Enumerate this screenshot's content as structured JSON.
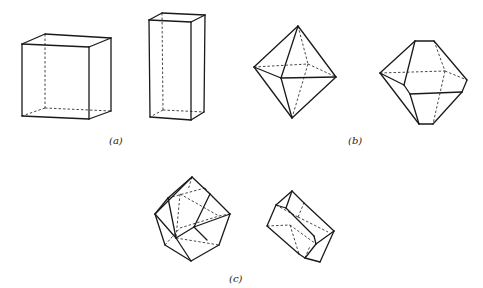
{
  "figure": {
    "panels": [
      {
        "label": "(a)",
        "label_pos": [
          116,
          143
        ],
        "shapes": [
          {
            "name": "cube",
            "solid": [
              [
                22,
                44,
                89,
                47
              ],
              [
                89,
                47,
                89,
                119
              ],
              [
                89,
                119,
                22,
                116
              ],
              [
                22,
                116,
                22,
                44
              ],
              [
                22,
                44,
                45,
                34
              ],
              [
                45,
                34,
                111,
                38
              ],
              [
                111,
                38,
                89,
                47
              ],
              [
                111,
                38,
                111,
                111
              ],
              [
                111,
                111,
                89,
                119
              ]
            ],
            "dashed": [
              [
                45,
                34,
                45,
                108
              ],
              [
                45,
                108,
                111,
                111
              ],
              [
                45,
                108,
                22,
                116
              ]
            ]
          },
          {
            "name": "tall-prism",
            "solid": [
              [
                149,
                20,
                191,
                22
              ],
              [
                191,
                22,
                191,
                120
              ],
              [
                191,
                120,
                150,
                117
              ],
              [
                150,
                117,
                149,
                20
              ],
              [
                149,
                20,
                162,
                13
              ],
              [
                162,
                13,
                205,
                15
              ],
              [
                205,
                15,
                191,
                22
              ],
              [
                205,
                15,
                204,
                112
              ],
              [
                204,
                112,
                191,
                120
              ]
            ],
            "dashed": [
              [
                162,
                13,
                163,
                110
              ],
              [
                163,
                110,
                204,
                112
              ],
              [
                163,
                110,
                150,
                117
              ]
            ]
          }
        ]
      },
      {
        "label": "(b)",
        "label_pos": [
          355,
          143
        ],
        "shapes": [
          {
            "name": "octahedron",
            "solid": [
              [
                298,
                26,
                254,
                67
              ],
              [
                298,
                26,
                281,
                78
              ],
              [
                298,
                26,
                336,
                77
              ],
              [
                254,
                67,
                281,
                78
              ],
              [
                281,
                78,
                336,
                77
              ],
              [
                254,
                67,
                292,
                118
              ],
              [
                281,
                78,
                292,
                118
              ],
              [
                336,
                77,
                292,
                118
              ]
            ],
            "dashed": [
              [
                254,
                67,
                308,
                64
              ],
              [
                308,
                64,
                336,
                77
              ],
              [
                298,
                26,
                308,
                64
              ],
              [
                308,
                64,
                292,
                118
              ]
            ]
          },
          {
            "name": "truncated-octahedron",
            "solid": [
              [
                415,
                41,
                434,
                41
              ],
              [
                415,
                41,
                380,
                73
              ],
              [
                415,
                41,
                404,
                85
              ],
              [
                434,
                41,
                467,
                80
              ],
              [
                380,
                73,
                404,
                85
              ],
              [
                404,
                85,
                410,
                94
              ],
              [
                410,
                94,
                462,
                92
              ],
              [
                462,
                92,
                467,
                80
              ],
              [
                380,
                73,
                419,
                124
              ],
              [
                410,
                94,
                419,
                124
              ],
              [
                419,
                124,
                433,
                124
              ],
              [
                433,
                124,
                462,
                92
              ]
            ],
            "dashed": [
              [
                380,
                73,
                445,
                71
              ],
              [
                445,
                71,
                467,
                80
              ],
              [
                434,
                41,
                445,
                71
              ],
              [
                445,
                71,
                433,
                124
              ]
            ]
          }
        ]
      },
      {
        "label": "(c)",
        "label_pos": [
          235,
          281
        ],
        "shapes": [
          {
            "name": "rhombic-dodecahedron",
            "solid": [
              [
                192,
                177,
                155,
                214
              ],
              [
                192,
                177,
                168,
                198
              ],
              [
                192,
                177,
                210,
                194
              ],
              [
                210,
                194,
                230,
                214
              ],
              [
                168,
                198,
                155,
                214
              ],
              [
                168,
                198,
                176,
                238
              ],
              [
                210,
                194,
                194,
                227
              ],
              [
                155,
                214,
                176,
                238
              ],
              [
                176,
                238,
                194,
                227
              ],
              [
                194,
                227,
                230,
                214
              ],
              [
                155,
                214,
                165,
                245
              ],
              [
                165,
                245,
                191,
                261
              ],
              [
                176,
                238,
                191,
                261
              ],
              [
                230,
                214,
                219,
                245
              ],
              [
                219,
                245,
                191,
                261
              ],
              [
                194,
                227,
                207,
                240
              ]
            ],
            "dashed": [
              [
                168,
                198,
                205,
                188
              ],
              [
                205,
                188,
                210,
                194
              ],
              [
                180,
                194,
                176,
                238
              ],
              [
                180,
                194,
                219,
                216
              ],
              [
                219,
                216,
                230,
                214
              ],
              [
                176,
                238,
                219,
                245
              ],
              [
                165,
                245,
                180,
                228
              ],
              [
                180,
                228,
                219,
                216
              ],
              [
                192,
                177,
                188,
                190
              ]
            ]
          },
          {
            "name": "elongated-dodecahedron",
            "solid": [
              [
                292,
                191,
                276,
                205
              ],
              [
                292,
                191,
                286,
                208
              ],
              [
                292,
                191,
                304,
                203
              ],
              [
                276,
                205,
                286,
                208
              ],
              [
                276,
                205,
                267,
                226
              ],
              [
                286,
                208,
                314,
                236
              ],
              [
                304,
                203,
                334,
                231
              ],
              [
                314,
                236,
                316,
                244
              ],
              [
                316,
                244,
                334,
                231
              ],
              [
                316,
                244,
                305,
                258
              ],
              [
                305,
                258,
                320,
                262
              ],
              [
                320,
                262,
                334,
                231
              ],
              [
                267,
                226,
                299,
                254
              ],
              [
                299,
                254,
                305,
                258
              ]
            ],
            "dashed": [
              [
                267,
                226,
                290,
                225
              ],
              [
                290,
                225,
                316,
                244
              ],
              [
                276,
                205,
                298,
                217
              ],
              [
                298,
                217,
                304,
                203
              ],
              [
                298,
                217,
                328,
                232
              ],
              [
                290,
                225,
                299,
                254
              ],
              [
                305,
                258,
                310,
                246
              ]
            ]
          }
        ]
      }
    ]
  }
}
